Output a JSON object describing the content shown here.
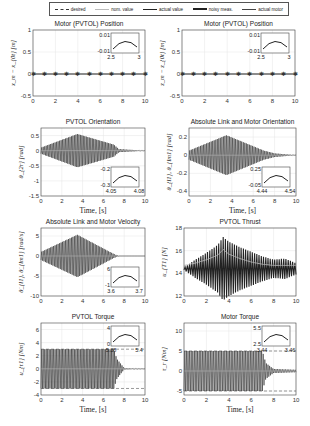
{
  "legend": {
    "items": [
      {
        "label": "desired",
        "style": "dashed-star"
      },
      {
        "label": "nom. value",
        "style": "thin-light"
      },
      {
        "label": "actual value",
        "style": "solid"
      },
      {
        "label": "noisy meas.",
        "style": "thick"
      },
      {
        "label": "actual motor",
        "style": "medium"
      }
    ]
  },
  "xlabel": "Time, [s]",
  "chart_data": [
    {
      "type": "line",
      "title": "Motor (PVTOL) Position",
      "ylabel": "x_m − x_{0t} [m]",
      "xlabel": "",
      "xlim": [
        0,
        10
      ],
      "ylim": [
        -0.5,
        1
      ],
      "xticks": [
        "0",
        "2",
        "4",
        "6",
        "8",
        "10"
      ],
      "yticks": [
        "1",
        "0.5",
        "0",
        "-0.5"
      ],
      "series": [
        {
          "name": "actual value",
          "x": [
            0,
            1,
            2,
            3,
            4,
            5,
            6,
            7,
            8,
            9,
            10
          ],
          "values": [
            0,
            0,
            0,
            0,
            0,
            0,
            0,
            0,
            0,
            0,
            0
          ]
        }
      ],
      "inset": {
        "xlim": [
          2.5,
          3
        ],
        "ylim": [
          -0.01,
          0.01
        ],
        "xticks": [
          "2.5",
          "3"
        ],
        "yticks": [
          "0.01",
          "-0.01"
        ]
      }
    },
    {
      "type": "line",
      "title": "Motor (PVTOL) Position",
      "ylabel": "z_m − z_{0t} [m]",
      "xlabel": "",
      "xlim": [
        0,
        10
      ],
      "ylim": [
        -0.5,
        1
      ],
      "xticks": [
        "0",
        "2",
        "4",
        "6",
        "8",
        "10"
      ],
      "yticks": [
        "1",
        "0.5",
        "0",
        "-0.5"
      ],
      "series": [
        {
          "name": "actual value",
          "x": [
            0,
            1,
            2,
            3,
            4,
            5,
            6,
            7,
            8,
            9,
            10
          ],
          "values": [
            0,
            0,
            0,
            0,
            0,
            0,
            0,
            0,
            0,
            0,
            0
          ]
        }
      ],
      "inset": {
        "xlim": [
          2.5,
          3
        ],
        "ylim": [
          -0.01,
          0.01
        ],
        "xticks": [
          "2.5",
          "3"
        ],
        "yticks": [
          "0.01",
          "-0.01"
        ]
      }
    },
    {
      "type": "line",
      "title": "PVTOL Orientation",
      "ylabel": "θ_{2r} [rad]",
      "xlabel": "Time, [s]",
      "xlim": [
        0,
        10
      ],
      "ylim": [
        -1.5,
        0.75
      ],
      "xticks": [
        "0",
        "2",
        "4",
        "6",
        "8",
        "10"
      ],
      "yticks": [
        "0.5",
        "0",
        "-0.5",
        "-1",
        "-1.5"
      ],
      "series": [
        {
          "name": "actual value",
          "envelope_amplitude": [
            [
              0,
              0.1
            ],
            [
              3.5,
              0.55
            ],
            [
              7,
              0.2
            ],
            [
              7.5,
              0.05
            ],
            [
              10,
              0
            ]
          ]
        }
      ],
      "inset": {
        "xlim": [
          4.05,
          4.08
        ],
        "ylim": [
          -0.3,
          -0.2
        ],
        "xticks": [
          "4.05",
          "4.08"
        ],
        "yticks": [
          "-0.2",
          "-0.3"
        ]
      }
    },
    {
      "type": "line",
      "title": "Absolute Link and Motor Orientation",
      "ylabel": "θ_{l1}, θ_{lm1} [rad]",
      "xlabel": "Time, [s]",
      "xlim": [
        0,
        10
      ],
      "ylim": [
        -0.45,
        0.3
      ],
      "xticks": [
        "0",
        "2",
        "4",
        "6",
        "8",
        "10"
      ],
      "yticks": [
        "0.2",
        "0",
        "-0.2",
        "-0.4"
      ],
      "series": [
        {
          "name": "actual value",
          "envelope_amplitude": [
            [
              0,
              0.05
            ],
            [
              3.5,
              0.22
            ],
            [
              7,
              0.05
            ],
            [
              8,
              0.02
            ],
            [
              10,
              0
            ]
          ]
        }
      ],
      "inset": {
        "xlim": [
          4.44,
          4.54
        ],
        "ylim": [
          -0.05,
          0.25
        ],
        "xticks": [
          "4.44",
          "4.54"
        ],
        "yticks": [
          "0.25",
          "-0.05"
        ]
      }
    },
    {
      "type": "line",
      "title": "Absolute Link and Motor Velocity",
      "ylabel": "θ̇_{l1}, θ̇_{lm1} [rad/s]",
      "xlabel": "",
      "xlim": [
        0,
        10
      ],
      "ylim": [
        -10,
        7
      ],
      "xticks": [
        "0",
        "2",
        "4",
        "6",
        "8",
        "10"
      ],
      "yticks": [
        "5",
        "0",
        "-5",
        "-10"
      ],
      "series": [
        {
          "name": "actual value",
          "envelope_amplitude": [
            [
              0,
              1
            ],
            [
              3.5,
              5.3
            ],
            [
              7,
              0.5
            ],
            [
              7.5,
              0
            ],
            [
              10,
              0
            ]
          ]
        }
      ],
      "inset": {
        "xlim": [
          3.6,
          3.7
        ],
        "ylim": [
          -1,
          6
        ],
        "xticks": [
          "3.6",
          "3.7"
        ],
        "yticks": [
          "6",
          "-1"
        ]
      }
    },
    {
      "type": "line",
      "title": "PVTOL Thrust",
      "ylabel": "u_{T1} [N]",
      "xlabel": "",
      "xlim": [
        0,
        10
      ],
      "ylim": [
        12,
        18
      ],
      "xticks": [
        "0",
        "2",
        "4",
        "6",
        "8",
        "10"
      ],
      "yticks": [
        "18",
        "16",
        "14",
        "12"
      ],
      "series": [
        {
          "name": "noisy meas.",
          "x": [
            0,
            1,
            2,
            3,
            3.5,
            4,
            5,
            6,
            7,
            8,
            9,
            10
          ],
          "values": [
            14.5,
            15.2,
            15.8,
            16.5,
            17.2,
            16.8,
            16.3,
            15.9,
            15.5,
            15.2,
            15.3,
            14.9
          ]
        },
        {
          "name": "nom. value",
          "x": [
            0,
            1,
            2,
            3,
            3.5,
            4,
            5,
            6,
            7,
            8,
            9,
            10
          ],
          "values": [
            14.7,
            14.9,
            15.2,
            15.6,
            16.1,
            15.7,
            15.3,
            15.0,
            14.8,
            14.7,
            14.7,
            14.7
          ]
        }
      ]
    },
    {
      "type": "line",
      "title": "PVTOL Torque",
      "ylabel": "u_{τ1} [Nm]",
      "xlabel": "Time, [s]",
      "xlim": [
        0,
        10
      ],
      "ylim": [
        -4,
        7
      ],
      "xticks": [
        "0",
        "2",
        "4",
        "6",
        "8",
        "10"
      ],
      "yticks": [
        "6",
        "4",
        "2",
        "0",
        "-2",
        "-4"
      ],
      "limits": [
        3,
        -3
      ],
      "series": [
        {
          "name": "actual value",
          "envelope_amplitude": [
            [
              0,
              3
            ],
            [
              7,
              3
            ],
            [
              7.3,
              1.5
            ],
            [
              8,
              0.1
            ],
            [
              10,
              0
            ]
          ]
        }
      ],
      "inset": {
        "xlim": [
          5.38,
          5.4
        ],
        "ylim": [
          0,
          4
        ],
        "xticks": [
          "5.38",
          "5.4"
        ],
        "yticks": [
          "4",
          "0"
        ]
      }
    },
    {
      "type": "line",
      "title": "Motor Torque",
      "ylabel": "τ_r [Nm]",
      "xlabel": "Time, [s]",
      "xlim": [
        0,
        10
      ],
      "ylim": [
        -6,
        12
      ],
      "xticks": [
        "0",
        "2",
        "4",
        "6",
        "8",
        "10"
      ],
      "yticks": [
        "10",
        "5",
        "0",
        "-5"
      ],
      "limits": [
        5,
        -5
      ],
      "series": [
        {
          "name": "actual value",
          "envelope_amplitude": [
            [
              0,
              5
            ],
            [
              3.5,
              5
            ],
            [
              7,
              5
            ],
            [
              7.3,
              2
            ],
            [
              8,
              0.5
            ],
            [
              10,
              0.3
            ]
          ]
        }
      ],
      "inset": {
        "xlim": [
          3.44,
          3.46
        ],
        "ylim": [
          2.5,
          5.5
        ],
        "xticks": [
          "3.44",
          "3.46"
        ],
        "yticks": [
          "5.5",
          "2.5"
        ]
      }
    }
  ]
}
